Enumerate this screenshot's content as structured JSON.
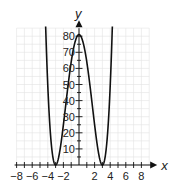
{
  "chart_data": {
    "type": "line",
    "title": "",
    "xlabel": "x",
    "ylabel": "y",
    "function": "y = (x^2 - 9)^2",
    "xlim": [
      -8,
      8
    ],
    "ylim": [
      0,
      80
    ],
    "x_ticks": [
      -8,
      -6,
      -4,
      -2,
      2,
      4,
      6,
      8
    ],
    "y_ticks": [
      10,
      20,
      30,
      40,
      50,
      60,
      70,
      80
    ],
    "grid": true,
    "legend": null,
    "series": [
      {
        "name": "f(x)",
        "x": [
          -4.3,
          -4,
          -3.5,
          -3,
          -2.5,
          -2,
          -1.5,
          -1,
          -0.5,
          0,
          0.5,
          1,
          1.5,
          2,
          2.5,
          3,
          3.5,
          4,
          4.3
        ],
        "values": [
          86.5,
          49,
          10.6,
          0,
          7.6,
          25,
          45.6,
          64,
          76.6,
          81,
          76.6,
          64,
          45.6,
          25,
          7.6,
          0,
          10.6,
          49,
          86.5
        ]
      }
    ],
    "annotations": [
      "x-intercepts at -3 and 3",
      "maximum near (0, 81)"
    ]
  },
  "labels": {
    "x_axis": "x",
    "y_axis": "y",
    "x_ticks": [
      "−8",
      "−6",
      "−4",
      "−2",
      "2",
      "4",
      "6",
      "8"
    ],
    "y_ticks": [
      "10",
      "20",
      "30",
      "40",
      "50",
      "60",
      "70",
      "80"
    ]
  },
  "colors": {
    "curve": "#111111",
    "axis": "#111111",
    "grid": "#e3e3e3"
  }
}
